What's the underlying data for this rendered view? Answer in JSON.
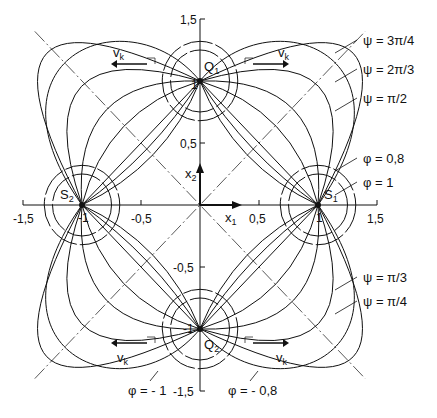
{
  "figure": {
    "origin_px": [
      200,
      205
    ],
    "scale_px": [
      118,
      124
    ],
    "ink": "#111111",
    "axes": {
      "x_label": "x",
      "x_sub": "1",
      "y_label": "x",
      "y_sub": "2",
      "x_ticks": [
        {
          "value": -1.5,
          "label": "-1,5"
        },
        {
          "value": -1,
          "label": "-1"
        },
        {
          "value": -0.5,
          "label": "-0,5"
        },
        {
          "value": 0.5,
          "label": "0,5"
        },
        {
          "value": 1,
          "label": "1"
        },
        {
          "value": 1.5,
          "label": "1,5"
        }
      ],
      "y_ticks": [
        {
          "value": 1.5,
          "label": "1,5"
        },
        {
          "value": 1,
          "label": "1"
        },
        {
          "value": 0.5,
          "label": "0,5"
        },
        {
          "value": -0.5,
          "label": "-0,5"
        },
        {
          "value": -1,
          "label": "-1"
        },
        {
          "value": -1.5,
          "label": "-1,5"
        }
      ]
    },
    "points": [
      {
        "name": "S",
        "sub": "1",
        "x": 1,
        "y": 0,
        "label_dx": 6,
        "label_dy": -6
      },
      {
        "name": "S",
        "sub": "2",
        "x": -1,
        "y": 0,
        "label_dx": -22,
        "label_dy": -6
      },
      {
        "name": "Q",
        "sub": "1",
        "x": 0,
        "y": 1,
        "label_dx": 4,
        "label_dy": -10
      },
      {
        "name": "Q",
        "sub": "2",
        "x": 0,
        "y": -1,
        "label_dx": 4,
        "label_dy": 20
      }
    ],
    "streamline_bulges": [
      0.35,
      0.7,
      1.2,
      1.9
    ],
    "potential_radii": [
      0.25,
      0.32
    ],
    "velocity_label": "v",
    "velocity_sub": "k",
    "legend_right": [
      {
        "text": "ψ = 3π/4",
        "x": 355,
        "y": 45
      },
      {
        "text": "ψ = 2π/3",
        "x": 355,
        "y": 74
      },
      {
        "text": "ψ = π/2",
        "x": 355,
        "y": 103
      },
      {
        "text": "φ = 0,8",
        "x": 355,
        "y": 163
      },
      {
        "text": "φ = 1",
        "x": 355,
        "y": 187
      },
      {
        "text": "ψ = π/3",
        "x": 355,
        "y": 282
      },
      {
        "text": "ψ = π/4",
        "x": 355,
        "y": 306
      }
    ],
    "legend_bottom": [
      {
        "text": "φ = - 1",
        "x": 128,
        "y": 395
      },
      {
        "text": "φ = - 0,8",
        "x": 228,
        "y": 395
      }
    ]
  }
}
